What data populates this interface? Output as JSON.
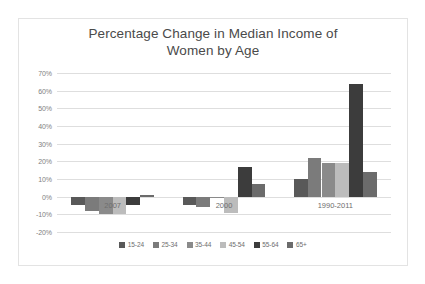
{
  "chart": {
    "title_line1": "Percentage Change in Median Income of",
    "title_line2": "Women by Age",
    "y_ticks": [
      "70%",
      "60%",
      "50%",
      "40%",
      "30%",
      "20%",
      "10%",
      "0%",
      "-10%",
      "-20%"
    ]
  },
  "chart_data": {
    "type": "bar",
    "title": "Percentage Change in Median Income of Women by Age",
    "xlabel": "",
    "ylabel": "",
    "ylim": [
      -20,
      70
    ],
    "ytick_values": [
      70,
      60,
      50,
      40,
      30,
      20,
      10,
      0,
      -10,
      -20
    ],
    "grid": true,
    "legend_position": "bottom",
    "categories": [
      "2007",
      "2000",
      "1990-2011"
    ],
    "series": [
      {
        "name": "15-24",
        "color": "#595959",
        "values": [
          -5,
          -5,
          10
        ]
      },
      {
        "name": "25-34",
        "color": "#7b7b7b",
        "values": [
          -8,
          -6,
          22
        ]
      },
      {
        "name": "35-44",
        "color": "#8a8a8a",
        "values": [
          -10,
          -1,
          19
        ]
      },
      {
        "name": "45-54",
        "color": "#bcbcbc",
        "values": [
          -10,
          -9,
          19
        ]
      },
      {
        "name": "55-64",
        "color": "#3c3c3c",
        "values": [
          -5,
          17,
          64
        ]
      },
      {
        "name": "65+",
        "color": "#6b6b6b",
        "values": [
          1,
          7,
          14
        ]
      }
    ]
  }
}
